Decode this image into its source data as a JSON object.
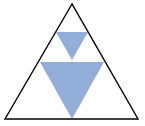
{
  "diagram": {
    "title": "",
    "background": "#ffffff",
    "outer_triangle": {
      "points": "72,4 5,119 138,119",
      "stroke": "#000000",
      "stroke_width": 1.4,
      "fill": "none"
    },
    "inner_triangles": [
      {
        "name": "small-inverted-triangle",
        "points": "56,32 88,32 72,60",
        "fill": "#92AED8"
      },
      {
        "name": "large-inverted-triangle",
        "points": "40,62 104,62 72,119",
        "fill": "#92AED8"
      }
    ]
  }
}
